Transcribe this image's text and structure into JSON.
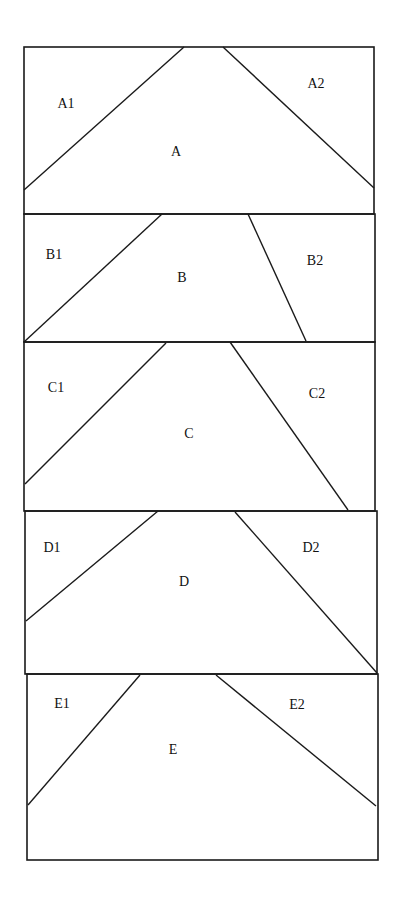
{
  "diagram": {
    "stroke_color": "#1a1a1a",
    "background": "#ffffff",
    "panels": [
      {
        "id": "A",
        "label": "A",
        "left_label": "A1",
        "right_label": "A2",
        "box": {
          "x1": 24,
          "y1": 47,
          "x2": 374,
          "y2": 214
        },
        "left_line": {
          "x1": 24,
          "y1": 190,
          "x2": 184,
          "y2": 47
        },
        "right_line": {
          "x1": 223,
          "y1": 47,
          "x2": 374,
          "y2": 188
        },
        "label_pos": {
          "x": 176,
          "y": 156
        },
        "left_label_pos": {
          "x": 66,
          "y": 108
        },
        "right_label_pos": {
          "x": 316,
          "y": 88
        }
      },
      {
        "id": "B",
        "label": "B",
        "left_label": "B1",
        "right_label": "B2",
        "box": {
          "x1": 24,
          "y1": 214,
          "x2": 375,
          "y2": 342
        },
        "left_line": {
          "x1": 24,
          "y1": 342,
          "x2": 162,
          "y2": 214
        },
        "right_line": {
          "x1": 248,
          "y1": 214,
          "x2": 306,
          "y2": 341
        },
        "label_pos": {
          "x": 182,
          "y": 282
        },
        "left_label_pos": {
          "x": 54,
          "y": 259
        },
        "right_label_pos": {
          "x": 315,
          "y": 265
        }
      },
      {
        "id": "C",
        "label": "C",
        "left_label": "C1",
        "right_label": "C2",
        "box": {
          "x1": 24,
          "y1": 342,
          "x2": 375,
          "y2": 511
        },
        "left_line": {
          "x1": 25,
          "y1": 484,
          "x2": 166,
          "y2": 343
        },
        "right_line": {
          "x1": 230,
          "y1": 342,
          "x2": 348,
          "y2": 510
        },
        "label_pos": {
          "x": 189,
          "y": 438
        },
        "left_label_pos": {
          "x": 56,
          "y": 392
        },
        "right_label_pos": {
          "x": 317,
          "y": 398
        }
      },
      {
        "id": "D",
        "label": "D",
        "left_label": "D1",
        "right_label": "D2",
        "box": {
          "x1": 25,
          "y1": 511,
          "x2": 377,
          "y2": 674
        },
        "left_line": {
          "x1": 26,
          "y1": 621,
          "x2": 158,
          "y2": 511
        },
        "right_line": {
          "x1": 235,
          "y1": 512,
          "x2": 377,
          "y2": 673
        },
        "label_pos": {
          "x": 184,
          "y": 586
        },
        "left_label_pos": {
          "x": 52,
          "y": 552
        },
        "right_label_pos": {
          "x": 311,
          "y": 552
        }
      },
      {
        "id": "E",
        "label": "E",
        "left_label": "E1",
        "right_label": "E2",
        "box": {
          "x1": 27,
          "y1": 674,
          "x2": 378,
          "y2": 860
        },
        "left_line": {
          "x1": 28,
          "y1": 805,
          "x2": 140,
          "y2": 675
        },
        "right_line": {
          "x1": 216,
          "y1": 675,
          "x2": 376,
          "y2": 806
        },
        "label_pos": {
          "x": 173,
          "y": 754
        },
        "left_label_pos": {
          "x": 62,
          "y": 708
        },
        "right_label_pos": {
          "x": 297,
          "y": 709
        }
      }
    ]
  }
}
